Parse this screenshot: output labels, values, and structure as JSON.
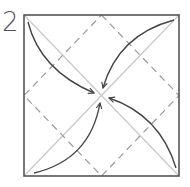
{
  "diagram": {
    "step_number": "2",
    "type": "origami fold diagram",
    "square": {
      "x": 24,
      "y": 15,
      "width": 155,
      "height": 161
    },
    "colors": {
      "border": "#555555",
      "diagonal": "#c8c8c8",
      "dashed": "#9a9a9a",
      "arrow": "#444444"
    },
    "elements": [
      "square-border",
      "two-diagonals",
      "dashed-valley-diamond",
      "four-curved-arrows-to-center"
    ]
  }
}
